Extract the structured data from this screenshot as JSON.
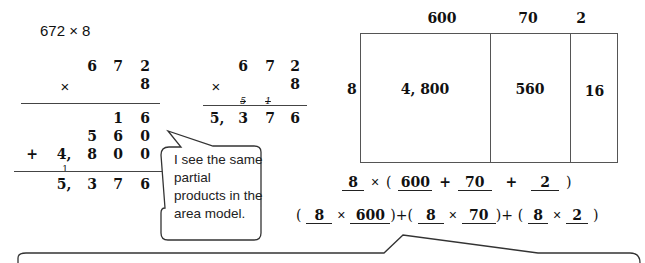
{
  "problem": {
    "expression": "672 × 8"
  },
  "standard_algorithm_partial": {
    "multiplicand": [
      "6",
      "7",
      "2"
    ],
    "operator": "×",
    "multiplier": "8",
    "partial_products": [
      [
        "",
        "",
        "1",
        "6"
      ],
      [
        "",
        "5",
        "6",
        "0"
      ],
      [
        "4,",
        "8",
        "0",
        "0"
      ]
    ],
    "plus_sign": "+",
    "carry": "1",
    "sum": [
      "5,",
      "3",
      "7",
      "6"
    ]
  },
  "standard_algorithm_compact": {
    "multiplicand": [
      "6",
      "7",
      "2"
    ],
    "operator": "×",
    "multiplier": "8",
    "carries": [
      "5",
      "1"
    ],
    "product": [
      "5,",
      "3",
      "7",
      "6"
    ]
  },
  "speech_bubble": {
    "text_lines": [
      "I see the same",
      "partial",
      "products in the",
      "area model."
    ]
  },
  "area_model": {
    "top_labels": [
      "600",
      "70",
      "2"
    ],
    "side_label": "8",
    "cells": [
      "4, 800",
      "560",
      "16"
    ]
  },
  "expressions": {
    "line1": {
      "a": "8",
      "times": "×",
      "open": "(",
      "b": "600",
      "plus1": "+",
      "c": "70",
      "plus2": "+",
      "d": "2",
      "close": ")"
    },
    "line2": [
      {
        "open": "(",
        "a": "8",
        "times": "×",
        "b": "600",
        "close": ")"
      },
      {
        "plus": "+"
      },
      {
        "open": "(",
        "a": "8",
        "times": "×",
        "b": "70",
        "close": ")"
      },
      {
        "plus": "+"
      },
      {
        "open": "(",
        "a": "8",
        "times": "×",
        "b": "2",
        "close": ")"
      }
    ]
  }
}
